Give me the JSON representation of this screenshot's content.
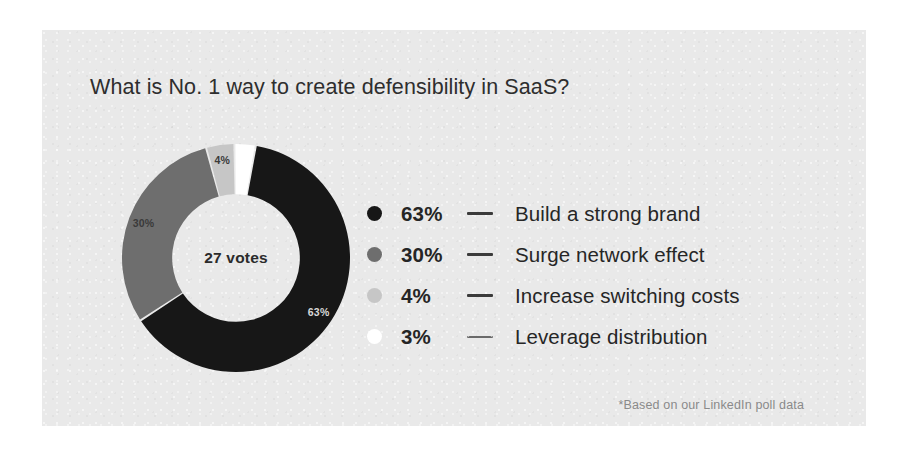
{
  "card": {
    "background_color": "#e9e9e9",
    "page_background_color": "#ffffff"
  },
  "title": "What is No. 1 way to create defensibility in SaaS?",
  "center": {
    "votes_label": "27 votes"
  },
  "footnote": "*Based on our LinkedIn poll data",
  "legend": {
    "rows": [
      {
        "percent": "63%",
        "label": "Build a strong brand",
        "color": "#171717",
        "dash_style": "solid"
      },
      {
        "percent": "30%",
        "label": "Surge network effect",
        "color": "#6e6e6e",
        "dash_style": "solid"
      },
      {
        "percent": "4%",
        "label": "Increase switching costs",
        "color": "#c6c6c6",
        "dash_style": "solid"
      },
      {
        "percent": "3%",
        "label": "Leverage distribution",
        "color": "#ffffff",
        "dash_style": "dashed"
      }
    ]
  },
  "chart_data": {
    "type": "pie",
    "variant": "donut",
    "title": "What is No. 1 way to create defensibility in SaaS?",
    "center_text": "27 votes",
    "total_votes": 27,
    "units": "percent",
    "categories": [
      "Build a strong brand",
      "Surge network effect",
      "Increase switching costs",
      "Leverage distribution"
    ],
    "values": [
      63,
      30,
      4,
      3
    ],
    "colors": [
      "#171717",
      "#6e6e6e",
      "#c6c6c6",
      "#ffffff"
    ],
    "slice_labels": [
      "63%",
      "30%",
      "4%",
      ""
    ],
    "legend_position": "right",
    "grid": false,
    "annotations": [
      "*Based on our LinkedIn poll data"
    ],
    "start_angle_deg": -80,
    "direction": "clockwise",
    "hole_ratio": 0.56
  }
}
